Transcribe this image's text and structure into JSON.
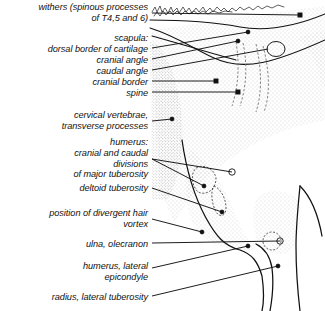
{
  "figure": {
    "style": "stippled line drawing with leader lines",
    "background_color": "#ffffff",
    "ink_color": "#111111",
    "stipple_color": "#8d8d8d"
  },
  "labels": [
    {
      "id": "withers",
      "lines": [
        "withers (spinous processes",
        "of T4,5 and 6)"
      ],
      "right": 148,
      "top": 2
    },
    {
      "id": "scapula",
      "lines": [
        "scapula:"
      ],
      "right": 148,
      "top": 33
    },
    {
      "id": "dorsal-border",
      "lines": [
        "dorsal border of cartilage"
      ],
      "right": 148,
      "top": 44
    },
    {
      "id": "cranial-angle",
      "lines": [
        "cranial angle"
      ],
      "right": 148,
      "top": 55
    },
    {
      "id": "caudal-angle",
      "lines": [
        "caudal angle"
      ],
      "right": 148,
      "top": 66
    },
    {
      "id": "cranial-border",
      "lines": [
        "cranial border"
      ],
      "right": 148,
      "top": 77
    },
    {
      "id": "spine",
      "lines": [
        "spine"
      ],
      "right": 148,
      "top": 88
    },
    {
      "id": "cervical-vertebrae",
      "lines": [
        "cervical vertebrae,",
        "transverse processes"
      ],
      "right": 148,
      "top": 110
    },
    {
      "id": "humerus",
      "lines": [
        "humerus:"
      ],
      "right": 148,
      "top": 137
    },
    {
      "id": "major-tuberosity",
      "lines": [
        "cranial and caudal",
        "divisions",
        "of major tuberosity"
      ],
      "right": 148,
      "top": 148
    },
    {
      "id": "deltoid-tuberosity",
      "lines": [
        "deltoid tuberosity"
      ],
      "right": 148,
      "top": 183
    },
    {
      "id": "hair-vortex",
      "lines": [
        "position of divergent hair",
        "vortex"
      ],
      "right": 148,
      "top": 208
    },
    {
      "id": "ulna-olecranon",
      "lines": [
        "ulna, olecranon"
      ],
      "right": 148,
      "top": 239
    },
    {
      "id": "lateral-epicondyle",
      "lines": [
        "humerus, lateral",
        "epicondyle"
      ],
      "right": 148,
      "top": 261
    },
    {
      "id": "radius-tuberosity",
      "lines": [
        "radius, lateral tuberosity"
      ],
      "right": 148,
      "top": 292
    }
  ],
  "leaders": [
    {
      "id": "withers",
      "x1": 152,
      "y1": 13,
      "x2": 300,
      "y2": 15,
      "terminal": "square"
    },
    {
      "id": "dorsal-border",
      "x1": 152,
      "y1": 48,
      "x2": 248,
      "y2": 32,
      "terminal": "dot"
    },
    {
      "id": "cranial-angle",
      "x1": 152,
      "y1": 59,
      "x2": 238,
      "y2": 41,
      "terminal": "dot"
    },
    {
      "id": "caudal-angle",
      "x1": 152,
      "y1": 70,
      "x2": 268,
      "y2": 49,
      "terminal": "ellipse"
    },
    {
      "id": "cranial-border",
      "x1": 152,
      "y1": 81,
      "x2": 216,
      "y2": 81,
      "terminal": "square"
    },
    {
      "id": "spine",
      "x1": 152,
      "y1": 92,
      "x2": 238,
      "y2": 92,
      "terminal": "square"
    },
    {
      "id": "cervical-vertebrae",
      "x1": 152,
      "y1": 121,
      "x2": 172,
      "y2": 119,
      "terminal": "dot"
    },
    {
      "id": "major-tuberosity-a",
      "x1": 152,
      "y1": 159,
      "x2": 232,
      "y2": 172,
      "terminal": "circle"
    },
    {
      "id": "major-tuberosity-b",
      "x1": 152,
      "y1": 159,
      "x2": 204,
      "y2": 186,
      "terminal": "dot"
    },
    {
      "id": "deltoid-tuberosity",
      "x1": 152,
      "y1": 188,
      "x2": 222,
      "y2": 212,
      "terminal": "dot"
    },
    {
      "id": "hair-vortex",
      "x1": 152,
      "y1": 219,
      "x2": 202,
      "y2": 232,
      "terminal": "dot"
    },
    {
      "id": "ulna-olecranon",
      "x1": 152,
      "y1": 243,
      "x2": 280,
      "y2": 241,
      "terminal": "circle"
    },
    {
      "id": "lateral-epicondyle",
      "x1": 152,
      "y1": 268,
      "x2": 248,
      "y2": 246,
      "terminal": "dot"
    },
    {
      "id": "radius-tuberosity",
      "x1": 152,
      "y1": 296,
      "x2": 278,
      "y2": 266,
      "terminal": "dot"
    }
  ]
}
